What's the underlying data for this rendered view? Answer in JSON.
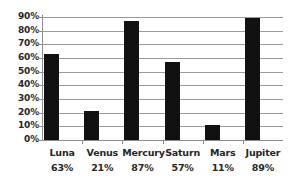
{
  "chart_data": {
    "type": "bar",
    "title": "",
    "xlabel": "",
    "ylabel": "",
    "categories": [
      "Luna",
      "Venus",
      "Mercury",
      "Saturn",
      "Mars",
      "Jupiter"
    ],
    "values": [
      63,
      21,
      87,
      57,
      11,
      89
    ],
    "value_labels": [
      "63%",
      "21%",
      "87%",
      "57%",
      "11%",
      "89%"
    ],
    "ylim": [
      0,
      90
    ],
    "ytick_values": [
      0,
      10,
      20,
      30,
      40,
      50,
      60,
      70,
      80,
      90
    ],
    "ytick_labels": [
      "0%",
      "10%",
      "20%",
      "30%",
      "40%",
      "50%",
      "60%",
      "70%",
      "80%",
      "90%"
    ],
    "grid": true,
    "legend": false,
    "legend_position": "none",
    "bar_color": "#111111",
    "gridline_color": "#9a9a9a",
    "axis_color": "#8c8c8c",
    "background_color": "#ffffff",
    "text_color": "#262626"
  }
}
